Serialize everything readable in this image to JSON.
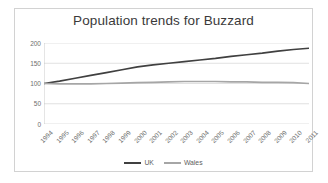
{
  "chart_data": {
    "type": "line",
    "title": "Population trends for Buzzard",
    "xlabel": "",
    "ylabel": "",
    "ylim": [
      0,
      200
    ],
    "yticks": [
      0,
      50,
      100,
      150,
      200
    ],
    "grid": true,
    "legend_position": "bottom",
    "categories": [
      "1994",
      "1995",
      "1996",
      "1997",
      "1998",
      "1999",
      "2000",
      "2001",
      "2002",
      "2003",
      "2004",
      "2005",
      "2006",
      "2007",
      "2008",
      "2009",
      "2010",
      "2011"
    ],
    "series": [
      {
        "name": "UK",
        "color": "#404040",
        "values": [
          100,
          106,
          113,
          120,
          127,
          134,
          141,
          146,
          150,
          154,
          158,
          162,
          167,
          171,
          175,
          180,
          184,
          187
        ]
      },
      {
        "name": "Wales",
        "color": "#a6a6a6",
        "values": [
          100,
          99,
          99,
          99,
          100,
          101,
          102,
          103,
          104,
          105,
          105,
          105,
          104,
          104,
          103,
          103,
          102,
          100
        ]
      }
    ]
  },
  "legend": {
    "items": [
      {
        "label": "UK",
        "key": "uk"
      },
      {
        "label": "Wales",
        "key": "wales"
      }
    ]
  },
  "colors": {
    "uk_line": "#404040",
    "wales_line": "#a6a6a6",
    "gridline": "#d9d9d9",
    "axis": "#bfbfbf",
    "border": "#d2d2d2",
    "text": "#6d6d6d",
    "title_text": "#3a3a3a",
    "background": "#ffffff"
  }
}
